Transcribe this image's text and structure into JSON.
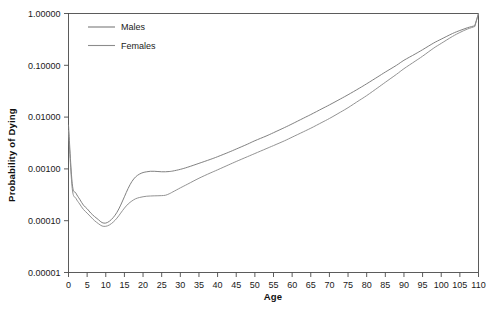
{
  "chart_data": {
    "type": "line",
    "title": "",
    "xlabel": "Age",
    "ylabel": "Probability of Dying",
    "xlim": [
      0,
      110
    ],
    "ylim": [
      1e-05,
      1.0
    ],
    "yscale": "log",
    "grid": false,
    "legend_position": "top-left",
    "xticks": [
      0,
      5,
      10,
      15,
      20,
      25,
      30,
      35,
      40,
      45,
      50,
      55,
      60,
      65,
      70,
      75,
      80,
      85,
      90,
      95,
      100,
      105,
      110
    ],
    "xtick_labels": [
      "0",
      "5",
      "10",
      "15",
      "20",
      "25",
      "30",
      "35",
      "40",
      "45",
      "50",
      "55",
      "60",
      "65",
      "70",
      "75",
      "80",
      "85",
      "90",
      "95",
      "100",
      "105",
      "110"
    ],
    "yticks": [
      1e-05,
      0.0001,
      0.001,
      0.01,
      0.1,
      1.0
    ],
    "ytick_labels": [
      "0.00001",
      "0.00010",
      "0.00100",
      "0.01000",
      "0.10000",
      "1.00000"
    ],
    "series": [
      {
        "name": "Males",
        "color": "#7a7a7a",
        "x": [
          0,
          1,
          2,
          3,
          4,
          5,
          6,
          7,
          8,
          9,
          10,
          11,
          12,
          13,
          14,
          15,
          16,
          17,
          18,
          19,
          20,
          21,
          22,
          23,
          24,
          25,
          26,
          27,
          28,
          30,
          32,
          35,
          38,
          40,
          43,
          45,
          48,
          50,
          53,
          55,
          58,
          60,
          63,
          65,
          68,
          70,
          73,
          75,
          78,
          80,
          83,
          85,
          88,
          90,
          93,
          95,
          98,
          100,
          103,
          105,
          107,
          109,
          110
        ],
        "y": [
          0.007,
          0.00052,
          0.00034,
          0.00026,
          0.0002,
          0.00017,
          0.00014,
          0.00012,
          0.000105,
          9.2e-05,
          9e-05,
          9.8e-05,
          0.000115,
          0.000145,
          0.0002,
          0.00029,
          0.00042,
          0.00057,
          0.0007,
          0.00079,
          0.00085,
          0.00088,
          0.0009,
          0.0009,
          0.00089,
          0.00088,
          0.00088,
          0.00089,
          0.00091,
          0.00098,
          0.00108,
          0.00128,
          0.00152,
          0.00172,
          0.0021,
          0.00242,
          0.003,
          0.0035,
          0.0043,
          0.005,
          0.0063,
          0.0074,
          0.0095,
          0.0112,
          0.0145,
          0.0172,
          0.0225,
          0.027,
          0.036,
          0.044,
          0.06,
          0.074,
          0.1,
          0.125,
          0.165,
          0.2,
          0.27,
          0.32,
          0.41,
          0.47,
          0.53,
          0.58,
          1.0
        ]
      },
      {
        "name": "Females",
        "color": "#8c8c8c",
        "x": [
          0,
          1,
          2,
          3,
          4,
          5,
          6,
          7,
          8,
          9,
          10,
          11,
          12,
          13,
          14,
          15,
          16,
          17,
          18,
          19,
          20,
          21,
          22,
          23,
          24,
          25,
          26,
          27,
          28,
          30,
          32,
          35,
          38,
          40,
          43,
          45,
          48,
          50,
          53,
          55,
          58,
          60,
          63,
          65,
          68,
          70,
          73,
          75,
          78,
          80,
          83,
          85,
          88,
          90,
          93,
          95,
          98,
          100,
          103,
          105,
          107,
          109,
          110
        ],
        "y": [
          0.0055,
          0.00042,
          0.00027,
          0.00021,
          0.000165,
          0.00014,
          0.000118,
          0.0001,
          8.8e-05,
          7.9e-05,
          7.8e-05,
          8.3e-05,
          9.4e-05,
          0.000112,
          0.00014,
          0.000175,
          0.00021,
          0.00024,
          0.000265,
          0.00028,
          0.00029,
          0.000297,
          0.0003,
          0.000302,
          0.000303,
          0.000305,
          0.00031,
          0.00033,
          0.00036,
          0.00043,
          0.00051,
          0.00066,
          0.00083,
          0.00096,
          0.0012,
          0.00139,
          0.00172,
          0.00198,
          0.00245,
          0.00282,
          0.0035,
          0.0041,
          0.0052,
          0.0061,
          0.0079,
          0.0094,
          0.0125,
          0.0152,
          0.021,
          0.026,
          0.037,
          0.047,
          0.067,
          0.086,
          0.12,
          0.15,
          0.215,
          0.265,
          0.36,
          0.43,
          0.5,
          0.56,
          1.0
        ]
      }
    ]
  },
  "legend": {
    "items": [
      {
        "label": "Males"
      },
      {
        "label": "Females"
      }
    ]
  }
}
